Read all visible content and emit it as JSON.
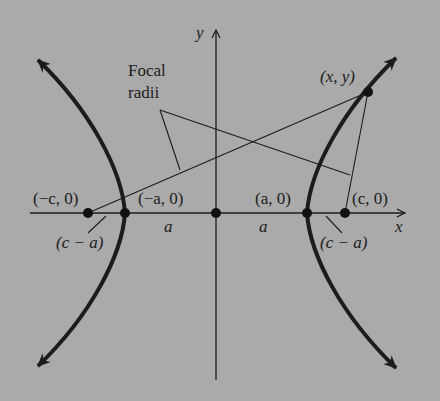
{
  "diagram": {
    "colors": {
      "background": "#aaaaaa",
      "ink": "#1c1c1c"
    },
    "axes": {
      "x_label": "x",
      "y_label": "y"
    },
    "annotation": {
      "line1": "Focal",
      "line2": "radii"
    },
    "points": {
      "left_focus": "(−c, 0)",
      "left_vertex": "(−a, 0)",
      "right_vertex": "(a, 0)",
      "right_focus": "(c, 0)",
      "curve_point": "(x, y)"
    },
    "segments": {
      "left_a": "a",
      "right_a": "a",
      "left_c_minus_a": "(c − a)",
      "right_c_minus_a": "(c − a)"
    }
  }
}
